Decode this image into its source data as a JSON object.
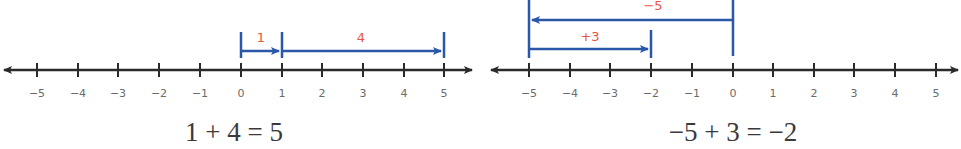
{
  "colors": {
    "axis": "#2a2a2a",
    "jump_arrow": "#2a57a8",
    "jump_label": "#e8553f",
    "tick_label": "#6b6b6b",
    "equation": "#3a3a3a"
  },
  "diagrams": [
    {
      "name": "left-number-line",
      "tick_labels": [
        "−5",
        "−4",
        "−3",
        "−2",
        "−1",
        "0",
        "1",
        "2",
        "3",
        "4",
        "5"
      ],
      "jumps": [
        {
          "from": 0,
          "to": 1,
          "label": "1"
        },
        {
          "from": 1,
          "to": 5,
          "label": "4"
        }
      ],
      "equation": "1 + 4 = 5"
    },
    {
      "name": "right-number-line",
      "tick_labels": [
        "−5",
        "−4",
        "−3",
        "−2",
        "−1",
        "0",
        "1",
        "2",
        "3",
        "4",
        "5"
      ],
      "jumps": [
        {
          "from": 0,
          "to": -5,
          "label": "−5"
        },
        {
          "from": -5,
          "to": -2,
          "label": "+3"
        }
      ],
      "equation": "−5 + 3 = −2"
    }
  ]
}
